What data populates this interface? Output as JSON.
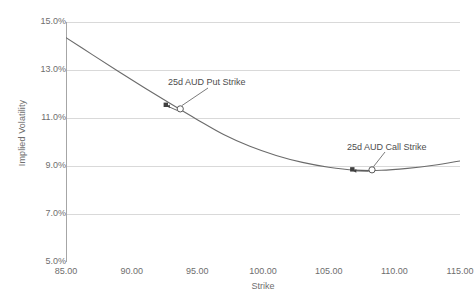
{
  "chart_data": {
    "type": "line",
    "title": "",
    "xlabel": "Strike",
    "ylabel": "Implied Volatility",
    "xlim": [
      85.0,
      115.0
    ],
    "ylim": [
      0.05,
      0.15
    ],
    "grid": true,
    "legend": "none",
    "xticks": [
      "85.00",
      "90.00",
      "95.00",
      "100.00",
      "105.00",
      "110.00",
      "115.00"
    ],
    "xtick_values": [
      85.0,
      90.0,
      95.0,
      100.0,
      105.0,
      110.0,
      115.0
    ],
    "yticks": [
      "5.0%",
      "7.0%",
      "9.0%",
      "11.0%",
      "13.0%",
      "15.0%"
    ],
    "ytick_values": [
      0.05,
      0.07,
      0.09,
      0.11,
      0.13,
      0.15
    ],
    "series": [
      {
        "name": "Implied Volatility Smile",
        "color": "#6b6b6b",
        "x": [
          85.0,
          87.0,
          89.0,
          91.0,
          93.0,
          95.0,
          97.0,
          99.0,
          101.0,
          103.0,
          105.0,
          107.0,
          109.0,
          111.0,
          113.0,
          115.0
        ],
        "values": [
          0.1435,
          0.1364,
          0.1294,
          0.1225,
          0.1158,
          0.1093,
          0.1031,
          0.0982,
          0.0944,
          0.0915,
          0.0895,
          0.0883,
          0.0882,
          0.089,
          0.0903,
          0.0921
        ]
      }
    ],
    "annotations": [
      {
        "name": "put-strike",
        "label": "25d AUD Put Strike",
        "x": 93.7,
        "y": 0.1138,
        "marker": "open-circle",
        "secondary_marker": "filled-square",
        "secondary_x": 92.6,
        "secondary_y": 0.1155
      },
      {
        "name": "call-strike",
        "label": "25d AUD Call Strike",
        "x": 108.3,
        "y": 0.0884,
        "marker": "open-circle",
        "secondary_marker": "filled-square",
        "secondary_x": 106.8,
        "secondary_y": 0.0886
      }
    ]
  },
  "axes": {
    "y_title": "Implied Volatility",
    "x_title": "Strike"
  },
  "caption": {
    "text": ""
  },
  "colors": {
    "line": "#6b6b6b",
    "grid": "#d9d9d9",
    "axis": "#a6a6a6",
    "text": "#6e6e6e",
    "annotation_text": "#4d4d4d",
    "marker_fill": "#ffffff",
    "marker_stroke": "#595959",
    "square_fill": "#3f3f3f"
  }
}
